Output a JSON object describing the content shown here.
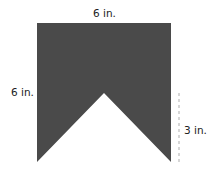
{
  "diagram": {
    "shape_color": "#4a4a4a",
    "dash_color": "#bbbbbb",
    "labels": {
      "top": "6 in.",
      "left": "6 in.",
      "notch": "3 in."
    }
  }
}
